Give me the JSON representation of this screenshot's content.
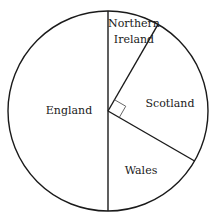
{
  "chart_data": {
    "type": "pie",
    "title": "",
    "units": "degrees",
    "categories": [
      "Northern Ireland",
      "Scotland",
      "Wales",
      "England"
    ],
    "values": [
      30,
      90,
      60,
      180
    ],
    "start_angle_deg_clockwise_from_top": 0,
    "annotations": [
      {
        "type": "right-angle-marker",
        "sector": "Scotland"
      }
    ],
    "legend": "none (labels inside sectors)"
  },
  "labels": {
    "northern_ireland_line1": "Northern",
    "northern_ireland_line2": "Ireland",
    "scotland": "Scotland",
    "wales": "Wales",
    "england": "England"
  },
  "colors": {
    "stroke": "#1a1a1a",
    "fill": "#ffffff",
    "marker": "#555555"
  }
}
